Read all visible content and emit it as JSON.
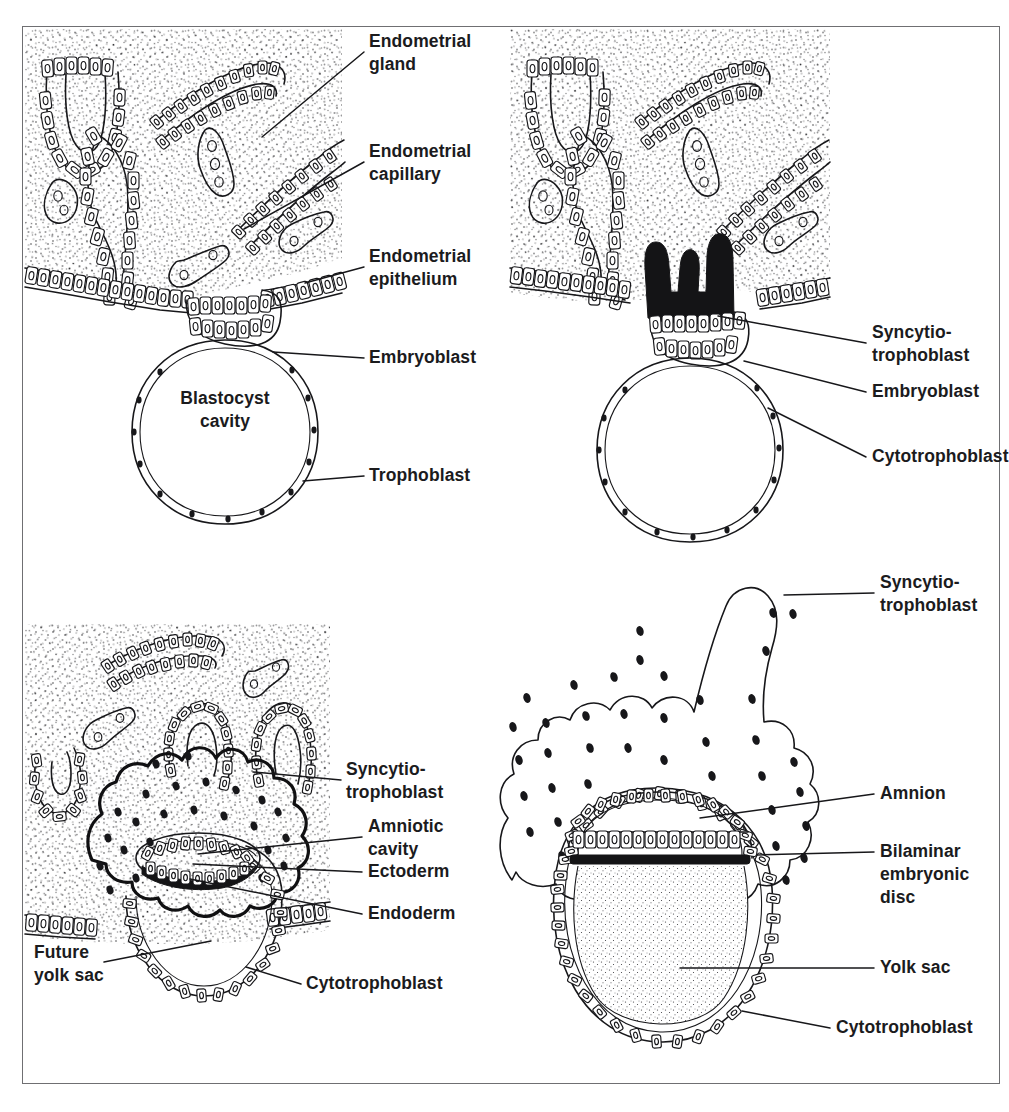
{
  "figure": {
    "frame_border_color": "#6f6f72",
    "ink_color": "#17171a",
    "background_color": "#ffffff",
    "panel_count": 4
  },
  "panels": [
    {
      "id": "panel-1",
      "position": "top-left",
      "description": "Free blastocyst apposed to endometrial epithelium",
      "labels": [
        {
          "id": "endometrial-gland",
          "lines": [
            "Endometrial",
            "gland"
          ],
          "x": 369,
          "y": 47,
          "leader": "M 364 52 L 262 137"
        },
        {
          "id": "endometrial-capillary",
          "lines": [
            "Endometrial",
            "capillary"
          ],
          "x": 369,
          "y": 157,
          "leader": "M 364 162 L 244 229"
        },
        {
          "id": "endometrial-epithelium",
          "lines": [
            "Endometrial",
            "epithelium"
          ],
          "x": 369,
          "y": 262,
          "leader": "M 364 267 L 305 283"
        },
        {
          "id": "embryoblast",
          "lines": [
            "Embryoblast"
          ],
          "x": 369,
          "y": 363,
          "leader": "M 364 358 L 273 352"
        },
        {
          "id": "trophoblast",
          "lines": [
            "Trophoblast"
          ],
          "x": 369,
          "y": 481,
          "leader": "M 364 476 L 303 481"
        },
        {
          "id": "blastocyst-cavity",
          "lines": [
            "Blastocyst",
            "cavity"
          ],
          "x": 225,
          "y": 404,
          "anchor": "middle"
        }
      ]
    },
    {
      "id": "panel-2",
      "position": "top-right",
      "description": "Blastocyst beginning to implant; syncytiotrophoblast invades epithelium",
      "labels": [
        {
          "id": "syncytiotrophoblast",
          "lines": [
            "Syncytio-",
            "trophoblast"
          ],
          "x": 872,
          "y": 338,
          "leader": "M 866 343 L 718 316"
        },
        {
          "id": "embryoblast",
          "lines": [
            "Embryoblast"
          ],
          "x": 872,
          "y": 397,
          "leader": "M 866 392 L 744 361"
        },
        {
          "id": "cytotrophoblast",
          "lines": [
            "Cytotrophoblast"
          ],
          "x": 872,
          "y": 462,
          "leader": "M 866 457 L 768 408"
        }
      ]
    },
    {
      "id": "panel-3",
      "position": "bottom-left",
      "description": "Implanted conceptus with amniotic cavity, bilaminar germ disc and future yolk sac",
      "labels": [
        {
          "id": "syncytiotrophoblast",
          "lines": [
            "Syncytio-",
            "trophoblast"
          ],
          "x": 346,
          "y": 775,
          "leader": "M 341 780 L 253 772"
        },
        {
          "id": "amniotic-cavity",
          "lines": [
            "Amniotic",
            "cavity"
          ],
          "x": 368,
          "y": 832,
          "anchor": "start",
          "leader": "M 362 837 L 198 854"
        },
        {
          "id": "ectoderm",
          "lines": [
            "Ectoderm"
          ],
          "x": 368,
          "y": 877,
          "leader": "M 362 872 L 193 864"
        },
        {
          "id": "endoderm",
          "lines": [
            "Endoderm"
          ],
          "x": 368,
          "y": 919,
          "leader": "M 362 914 L 190 879"
        },
        {
          "id": "future-yolk-sac",
          "lines": [
            "Future",
            "yolk sac"
          ],
          "x": 34,
          "y": 958,
          "leader": "M 104 962 L 211 941"
        },
        {
          "id": "cytotrophoblast",
          "lines": [
            "Cytotrophoblast"
          ],
          "x": 306,
          "y": 989,
          "leader": "M 301 984 L 246 967"
        }
      ]
    },
    {
      "id": "panel-4",
      "position": "bottom-right",
      "description": "Later conceptus: bilaminar embryonic disc between amniotic cavity and yolk sac",
      "labels": [
        {
          "id": "syncytiotrophoblast",
          "lines": [
            "Syncytio-",
            "trophoblast"
          ],
          "x": 880,
          "y": 588,
          "leader": "M 874 593 L 784 595"
        },
        {
          "id": "amnion",
          "lines": [
            "Amnion"
          ],
          "x": 880,
          "y": 799,
          "leader": "M 874 794 L 700 818"
        },
        {
          "id": "bilaminar-embryonic-disc",
          "lines": [
            "Bilaminar",
            "embryonic",
            "disc"
          ],
          "x": 880,
          "y": 857,
          "leader": "M 874 852 L 757 855"
        },
        {
          "id": "yolk-sac",
          "lines": [
            "Yolk sac"
          ],
          "x": 880,
          "y": 973,
          "leader": "M 874 968 L 680 968"
        },
        {
          "id": "cytotrophoblast",
          "lines": [
            "Cytotrophoblast"
          ],
          "x": 836,
          "y": 1033,
          "leader": "M 830 1028 L 742 1011"
        }
      ]
    }
  ],
  "structures": {
    "endometrial_stroma": "stippled connective tissue",
    "endometrial_gland": "coiled tubular gland lined by columnar cells",
    "endometrial_capillary": "small oval vessel profiles in stroma",
    "endometrial_epithelium": "surface layer of columnar cells",
    "trophoblast": "thin outer cell layer of blastocyst with nuclei",
    "embryoblast": "inner cell mass cluster",
    "blastocyst_cavity": "fluid-filled cavity",
    "syncytiotrophoblast": "solid dark multinucleated invasive mass",
    "cytotrophoblast": "cellular inner trophoblast layer",
    "amniotic_cavity": "slit cavity above ectoderm",
    "ectoderm": "dark epiblast band",
    "endoderm": "hypoblast layer",
    "yolk_sac": "stippled exocoelomic cavity"
  }
}
